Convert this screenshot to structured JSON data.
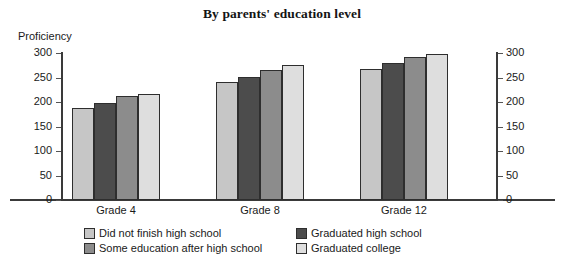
{
  "chart_data": {
    "type": "bar",
    "title": "By parents' education level",
    "xlabel": "",
    "ylabel": "Proficiency",
    "categories": [
      "Grade 4",
      "Grade 8",
      "Grade 12"
    ],
    "ylim": [
      0,
      300
    ],
    "yticks": [
      0,
      50,
      100,
      150,
      200,
      250,
      300
    ],
    "ytick_labels_left": [
      "0",
      "50",
      "100",
      "150",
      "200",
      "250",
      "300"
    ],
    "ytick_labels_right": [
      "0",
      "50",
      "100",
      "150",
      "200",
      "250",
      "300"
    ],
    "grid": false,
    "legend_position": "bottom",
    "series": [
      {
        "name": "Did not finish high school",
        "color": "#c6c6c6",
        "values": [
          188,
          240,
          267
        ]
      },
      {
        "name": "Graduated high school",
        "color": "#4c4c4c",
        "values": [
          199,
          252,
          279
        ]
      },
      {
        "name": "Some education after high school",
        "color": "#8c8c8c",
        "values": [
          212,
          265,
          292
        ]
      },
      {
        "name": "Graduated college",
        "color": "#dedede",
        "values": [
          217,
          275,
          298
        ]
      }
    ],
    "legend_order": [
      "Did not finish high school",
      "Graduated high school",
      "Some education after high school",
      "Graduated college"
    ]
  }
}
